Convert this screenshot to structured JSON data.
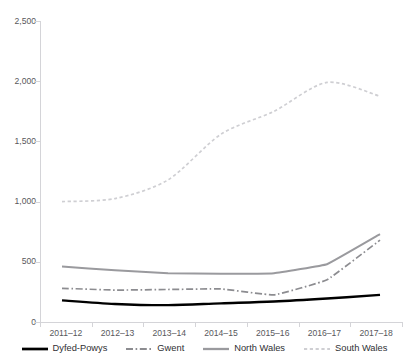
{
  "chart_data": {
    "type": "line",
    "title": "",
    "xlabel": "",
    "ylabel": "",
    "ylim": [
      0,
      2500
    ],
    "yticks": [
      "0",
      "500",
      "1,000",
      "1,500",
      "2,000",
      "2,500"
    ],
    "ytick_values": [
      0,
      500,
      1000,
      1500,
      2000,
      2500
    ],
    "grid": false,
    "legend_position": "bottom",
    "categories": [
      "2011–12",
      "2012–13",
      "2013–14",
      "2014–15",
      "2015–16",
      "2016–17",
      "2017–18"
    ],
    "series": [
      {
        "name": "Dyfed-Powys",
        "color": "#000000",
        "style": "solid",
        "values": [
          180,
          150,
          140,
          155,
          170,
          195,
          225
        ]
      },
      {
        "name": "Gwent",
        "color": "#8c8c90",
        "style": "dashdot",
        "values": [
          280,
          265,
          270,
          275,
          225,
          350,
          680
        ]
      },
      {
        "name": "North Wales",
        "color": "#9a9a9e",
        "style": "solid",
        "values": [
          460,
          430,
          405,
          400,
          405,
          480,
          730
        ]
      },
      {
        "name": "South Wales",
        "color": "#cfcfd3",
        "style": "dotted",
        "values": [
          1000,
          1025,
          1180,
          1560,
          1750,
          1990,
          1875
        ]
      }
    ]
  },
  "legend": {
    "items": [
      {
        "label": "Dyfed-Powys"
      },
      {
        "label": "Gwent"
      },
      {
        "label": "North Wales"
      },
      {
        "label": "South Wales"
      }
    ]
  },
  "axes": {
    "y_labels": [
      "2,500",
      "2,000",
      "1,500",
      "1,000",
      "500",
      "0"
    ],
    "x_labels": [
      "2011–12",
      "2012–13",
      "2013–14",
      "2014–15",
      "2015–16",
      "2016–17",
      "2017–18"
    ]
  },
  "colors": {
    "axis": "#d4d4d8",
    "tick_text": "#58585c",
    "legend_text": "#2f2f33",
    "series_dyfed_powys": "#000000",
    "series_gwent": "#8c8c90",
    "series_north_wales": "#9a9a9e",
    "series_south_wales": "#cfcfd3"
  }
}
